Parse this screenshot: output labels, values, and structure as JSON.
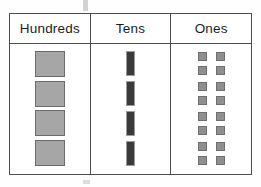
{
  "chart_data": {
    "type": "table",
    "columns": [
      "Hundreds",
      "Tens",
      "Ones"
    ],
    "representation": "base-ten-blocks",
    "groups": [
      {
        "place": "Hundreds",
        "block_type": "flat",
        "count": 4,
        "block_value": 100,
        "place_value": 400
      },
      {
        "place": "Tens",
        "block_type": "rod",
        "count": 4,
        "block_value": 10,
        "place_value": 40
      },
      {
        "place": "Ones",
        "block_type": "unit",
        "group_count": 4,
        "units_per_group": 4,
        "count": 16,
        "block_value": 1,
        "place_value": 16
      }
    ],
    "colors": {
      "flat_fill": "#a6a6a6",
      "flat_border": "#6b6b6b",
      "rod_fill": "#3a3a3a",
      "rod_border": "#9a9a9a",
      "unit_fill": "#8f8f8f",
      "unit_border": "#6f6f6f",
      "table_border": "#4d4d4d",
      "background": "#ffffff",
      "text": "#1c1c1c"
    }
  },
  "table": {
    "headers": {
      "hundreds": "Hundreds",
      "tens": "Tens",
      "ones": "Ones"
    }
  }
}
